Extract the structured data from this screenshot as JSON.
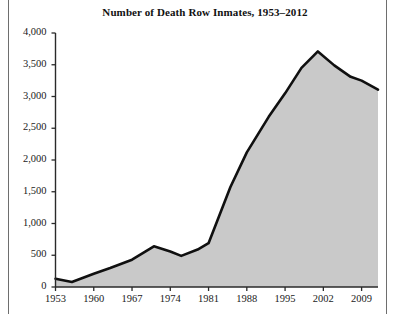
{
  "figure": {
    "title": "Number of Death Row Inmates, 1953–2012",
    "area_fill_color": "#c9c9c9",
    "line_color": "#101010",
    "axis_color": "#2a2a2a",
    "rule_color": "#6e6e6e",
    "background_color": "#ffffff"
  },
  "chart_data": {
    "type": "area",
    "title": "Number of Death Row Inmates, 1953–2012",
    "xlabel": "",
    "ylabel": "",
    "xlim": [
      1953,
      2012
    ],
    "ylim": [
      0,
      4000
    ],
    "grid": false,
    "legend": "none",
    "xticks": [
      1953,
      1960,
      1967,
      1974,
      1981,
      1988,
      1995,
      2002,
      2009
    ],
    "xtick_labels": [
      "1953",
      "1960",
      "1967",
      "1974",
      "1981",
      "1988",
      "1995",
      "2002",
      "2009"
    ],
    "yticks": [
      0,
      500,
      1000,
      1500,
      2000,
      2500,
      3000,
      3500,
      4000
    ],
    "ytick_labels": [
      "0",
      "500",
      "1,000",
      "1,500",
      "2,000",
      "2,500",
      "3,000",
      "3,500",
      "4,000"
    ],
    "series": [
      {
        "name": "Death row inmates",
        "x": [
          1953,
          1956,
          1960,
          1963,
          1967,
          1971,
          1974,
          1976,
          1979,
          1981,
          1985,
          1988,
          1992,
          1995,
          1998,
          2001,
          2004,
          2007,
          2009,
          2012
        ],
        "values": [
          130,
          80,
          210,
          300,
          430,
          640,
          560,
          490,
          590,
          690,
          1575,
          2120,
          2680,
          3050,
          3450,
          3710,
          3490,
          3310,
          3250,
          3110
        ]
      }
    ]
  },
  "annotations": {
    "peak_year": "2001",
    "peak_value": "3,710"
  }
}
